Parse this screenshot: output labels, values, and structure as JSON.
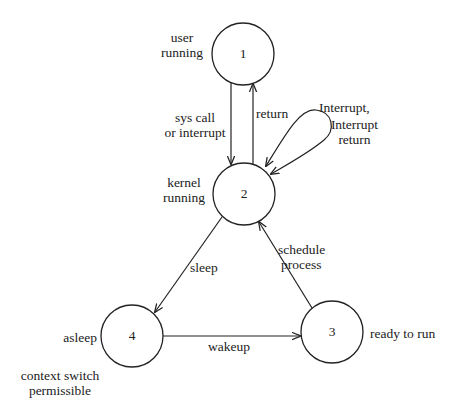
{
  "diagram": {
    "type": "state-transition",
    "states": [
      {
        "id": "1",
        "label": "1",
        "description": "user running"
      },
      {
        "id": "2",
        "label": "2",
        "description": "kernel running"
      },
      {
        "id": "3",
        "label": "3",
        "description": "ready to run"
      },
      {
        "id": "4",
        "label": "4",
        "description": "asleep",
        "note": "context switch permissible"
      }
    ],
    "transitions": [
      {
        "from": "1",
        "to": "2",
        "label_line1": "sys call",
        "label_line2": "or interrupt"
      },
      {
        "from": "2",
        "to": "1",
        "label": "return"
      },
      {
        "from": "2",
        "to": "2",
        "label_line1": "Interrupt,",
        "label_line2": "Interrupt",
        "label_line3": "return"
      },
      {
        "from": "2",
        "to": "4",
        "label": "sleep"
      },
      {
        "from": "4",
        "to": "3",
        "label": "wakeup"
      },
      {
        "from": "3",
        "to": "2",
        "label_line1": "schedule",
        "label_line2": "process"
      }
    ],
    "state_desc": {
      "s1_line1": "user",
      "s1_line2": "running",
      "s2_line1": "kernel",
      "s2_line2": "running",
      "s3": "ready to run",
      "s4": "asleep",
      "s4_note_line1": "context switch",
      "s4_note_line2": "permissible"
    }
  }
}
